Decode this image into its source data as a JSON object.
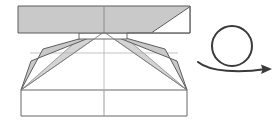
{
  "figure": {
    "background_color": "#ffffff"
  },
  "colors": {
    "paper_fill": "#c9c9c9",
    "paper_fill_light": "#d2d2d2",
    "white_fill": "#ffffff",
    "outline_dark": "#555555",
    "outline_mid": "#777777",
    "crease_light": "#aaaaaa",
    "arrow_stroke": "#3a3a3a"
  },
  "model": {
    "label": "folded-model",
    "top_bar": {
      "name": "top-horizontal-bar",
      "fill": "#c9c9c9",
      "points": "18,6 190,6 190,33 18,33",
      "x": 18,
      "y": 6,
      "width": 172,
      "height": 27
    },
    "top_bar_white_triangle": {
      "name": "top-bar-white-corner-triangle",
      "fill": "#ffffff",
      "points": "152,33 190,33 190,7"
    },
    "top_bar_center_crease": {
      "name": "top-bar-center-vertical-crease",
      "x1": 104,
      "y1": 6,
      "x2": 104,
      "y2": 33
    },
    "center_tab": {
      "name": "center-white-tab",
      "fill": "#ffffff",
      "points": "79,33 127,33 127,39 79,39"
    },
    "apex": {
      "name": "convergence-apex-point",
      "x": 104,
      "y": 32
    },
    "left_wing": {
      "name": "left-wing-flap",
      "fill": "#c9c9c9",
      "points": "104,32 43,48 21,90 30,60"
    },
    "right_wing": {
      "name": "right-wing-flap",
      "fill": "#c9c9c9",
      "points": "104,32 165,48 187,90 178,60"
    },
    "left_inner_gusset": {
      "name": "left-inner-gusset",
      "fill": "#d2d2d2",
      "points": "104,32 79,39 21,90"
    },
    "right_inner_gusset": {
      "name": "right-inner-gusset",
      "fill": "#d2d2d2",
      "points": "104,32 127,39 187,90"
    },
    "bottom_panel": {
      "name": "bottom-rectangle-panel",
      "fill": "#ffffff",
      "points": "21,90 187,90 187,116 21,116",
      "x": 21,
      "y": 90,
      "width": 166,
      "height": 26
    },
    "bottom_center_crease": {
      "name": "bottom-center-vertical-crease",
      "x1": 104,
      "y1": 90,
      "x2": 104,
      "y2": 116
    },
    "mid_vertical_crease": {
      "name": "middle-center-vertical-crease",
      "x1": 104,
      "y1": 32,
      "x2": 104,
      "y2": 90
    },
    "mid_horizontal_crease": {
      "name": "middle-horizontal-crease",
      "x1": 30,
      "y1": 53,
      "x2": 178,
      "y2": 53
    }
  },
  "symbol": {
    "name": "turn-over-rotate-arrow",
    "meaning": "rotate / turn the model over",
    "loop": {
      "cx": 232,
      "cy": 46,
      "r": 20
    },
    "tail_start": {
      "x": 198,
      "y": 63
    },
    "arrow_tip": {
      "x": 272,
      "y": 70
    },
    "stroke": "#3a3a3a"
  }
}
